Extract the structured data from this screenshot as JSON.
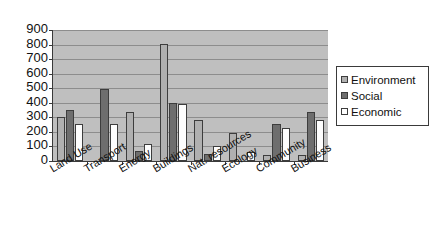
{
  "chart_data": {
    "type": "bar",
    "title": "",
    "subtitle": "",
    "xlabel": "",
    "ylabel": "",
    "ylim": [
      0,
      900
    ],
    "ytick_step": 100,
    "yticks": [
      "900",
      "800",
      "700",
      "600",
      "500",
      "400",
      "300",
      "200",
      "100",
      "0"
    ],
    "grid": true,
    "legend_position": "right",
    "categories": [
      "Land Use",
      "Transport",
      "Energy",
      "Buildings",
      "Nat. resources",
      "Ecology",
      "Community",
      "Business"
    ],
    "series": [
      {
        "name": "Environment",
        "color": "#b0b0b0",
        "values": [
          300,
          0,
          340,
          805,
          280,
          190,
          40,
          40
        ]
      },
      {
        "name": "Social",
        "color": "#6e6e6e",
        "values": [
          350,
          495,
          70,
          400,
          50,
          0,
          255,
          335
        ]
      },
      {
        "name": "Economic",
        "color": "#fdfdfd",
        "values": [
          255,
          255,
          120,
          395,
          105,
          65,
          230,
          280
        ]
      }
    ]
  },
  "legend": {
    "items": [
      {
        "label": "Environment",
        "swatch": "legend-swatch-environment"
      },
      {
        "label": "Social",
        "swatch": "legend-swatch-social"
      },
      {
        "label": "Economic",
        "swatch": "legend-swatch-economic"
      }
    ]
  },
  "colors": {
    "plot_background": "#bfbfbf",
    "gridline": "#8d8d8d",
    "axis": "#3a3a3a",
    "bar_outline": "#3d3d3d",
    "page_background": "#ffffff",
    "text": "#111111"
  }
}
